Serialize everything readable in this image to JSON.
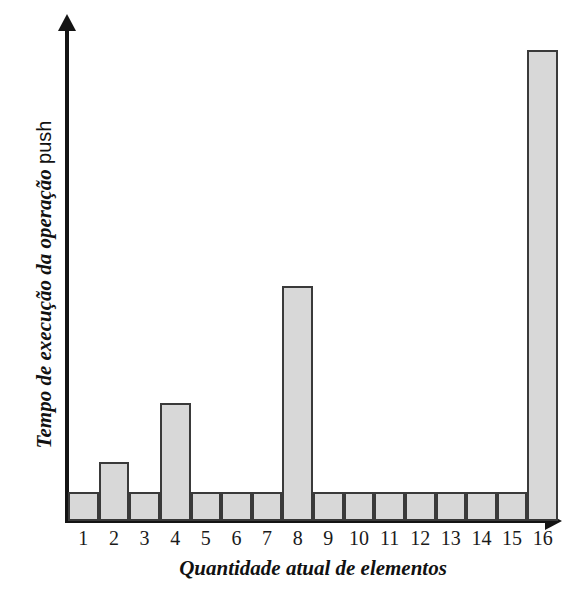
{
  "chart_data": {
    "type": "bar",
    "title": "",
    "xlabel": "Quantidade atual de elementos",
    "ylabel_italic": "Tempo de execução da operação",
    "ylabel_code": "push",
    "ylabel_full": "Tempo de execução da operação push",
    "categories": [
      "1",
      "2",
      "3",
      "4",
      "5",
      "6",
      "7",
      "8",
      "9",
      "10",
      "11",
      "12",
      "13",
      "14",
      "15",
      "16"
    ],
    "values": [
      1,
      2,
      1,
      4,
      1,
      1,
      1,
      8,
      1,
      1,
      1,
      1,
      1,
      1,
      1,
      16
    ],
    "ylim": [
      0,
      17.1
    ],
    "xlim": [
      0.5,
      16.5
    ],
    "grid": false,
    "legend": null,
    "bar_fill_color": "#d8d8d8",
    "bar_edge_color": "#3a3a3a",
    "axis_color": "#141414"
  },
  "axis": {
    "y_arrow": "up-arrow",
    "x_arrow": "right-arrow"
  }
}
